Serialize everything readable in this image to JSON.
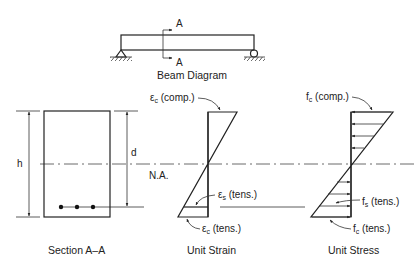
{
  "beam_diagram": {
    "caption": "Beam Diagram",
    "section_marker_top": "A",
    "section_marker_bottom": "A",
    "supports": [
      "pin",
      "roller"
    ]
  },
  "section": {
    "caption": "Section A–A",
    "dimension_h": "h",
    "dimension_d": "d",
    "rebar_count": 3
  },
  "neutral_axis": {
    "label": "N.A."
  },
  "strain": {
    "caption": "Unit Strain",
    "comp_symbol": "ε",
    "comp_sub": "c",
    "comp_text": "(comp.)",
    "steel_symbol": "ε",
    "steel_sub": "s",
    "steel_text": "(tens.)",
    "tens_symbol": "ε",
    "tens_sub": "c",
    "tens_text": "(tens.)"
  },
  "stress": {
    "caption": "Unit Stress",
    "comp_symbol": "f",
    "comp_sub": "c",
    "comp_text": "(comp.)",
    "steel_symbol": "f",
    "steel_sub": "s",
    "steel_text": "(tens.)",
    "tens_symbol": "f",
    "tens_sub": "c",
    "tens_text": "(tens.)"
  },
  "colors": {
    "line": "#222222",
    "background": "#ffffff"
  }
}
